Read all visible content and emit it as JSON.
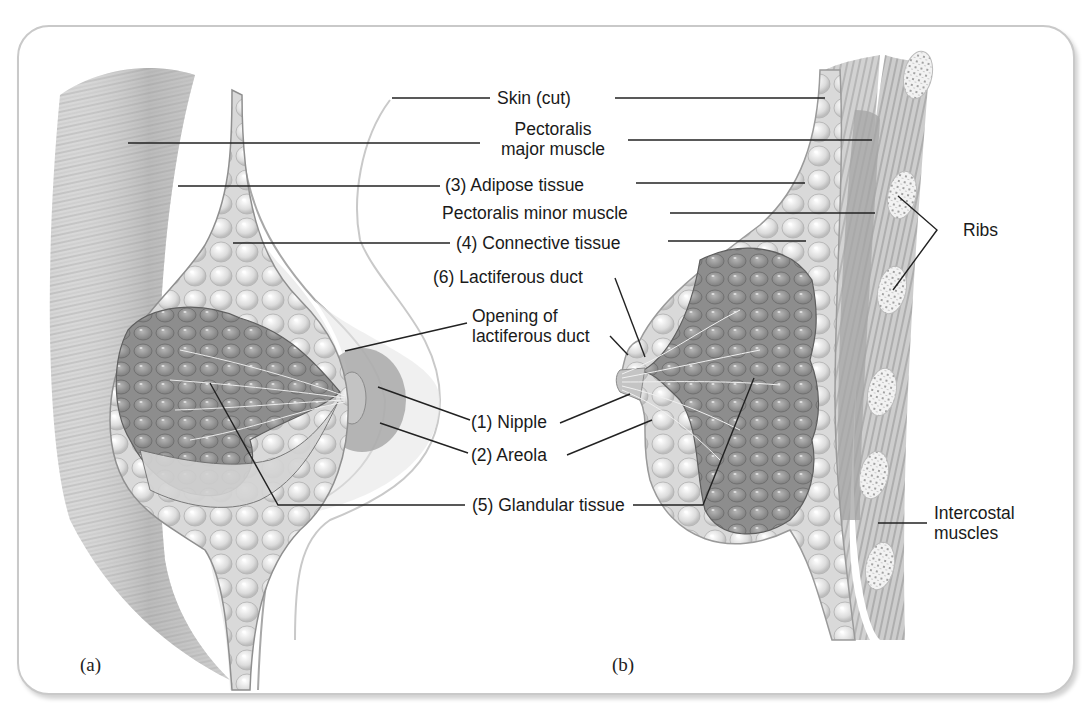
{
  "figure": {
    "panels": [
      {
        "id": "a",
        "label": "(a)",
        "view": "anterior cutaway"
      },
      {
        "id": "b",
        "label": "(b)",
        "view": "sagittal section"
      }
    ],
    "labels": {
      "skin": "Skin (cut)",
      "pec_major_1": "Pectoralis",
      "pec_major_2": "major muscle",
      "adipose": "(3) Adipose tissue",
      "pec_minor": "Pectoralis minor muscle",
      "connective": "(4) Connective tissue",
      "lactiferous_duct": "(6) Lactiferous duct",
      "opening_1": "Opening of",
      "opening_2": "lactiferous duct",
      "nipple": "(1) Nipple",
      "areola": "(2) Areola",
      "glandular": "(5) Glandular tissue",
      "ribs": "Ribs",
      "intercostal_1": "Intercostal",
      "intercostal_2": "muscles"
    },
    "colors": {
      "frame_border": "#c9c9c9",
      "leader_line": "#222222",
      "tissue_light": "#e6e6e6",
      "gland_dark": "#8c8c8c",
      "areola": "#a8a8a8"
    }
  }
}
